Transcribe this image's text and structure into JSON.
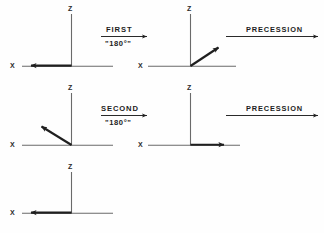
{
  "figure": {
    "ink_color": "#262626",
    "axis_color": "#555555",
    "background": "#fefefe"
  },
  "frames": [
    {
      "id": "frame-1",
      "row": 1,
      "position": "top-left",
      "z_label": "Z",
      "x_label": "X",
      "vector": {
        "direction": "minus-x",
        "angle_deg": 180,
        "description": "arrow along negative X axis"
      }
    },
    {
      "id": "frame-2",
      "row": 1,
      "position": "top-right",
      "z_label": "Z",
      "x_label": "X",
      "vector": {
        "direction": "up-right",
        "angle_deg": 33,
        "description": "arrow up and to the right from origin"
      }
    },
    {
      "id": "frame-3",
      "row": 2,
      "position": "middle-left",
      "z_label": "Z",
      "x_label": "X",
      "vector": {
        "direction": "up-left",
        "angle_deg": 147,
        "description": "arrow up and to the left from origin"
      }
    },
    {
      "id": "frame-4",
      "row": 2,
      "position": "middle-right",
      "z_label": "Z",
      "x_label": "X",
      "vector": {
        "direction": "plus-x",
        "angle_deg": 0,
        "description": "arrow along positive X axis"
      }
    },
    {
      "id": "frame-5",
      "row": 3,
      "position": "bottom-left",
      "z_label": "Z",
      "x_label": "X",
      "vector": {
        "direction": "minus-x",
        "angle_deg": 180,
        "description": "arrow along negative X axis"
      }
    }
  ],
  "operations": [
    {
      "id": "op-first",
      "row": 1,
      "label_top": "FIRST",
      "label_bottom": "\"180°\"",
      "arrow": "right-arrow"
    },
    {
      "id": "op-precession-1",
      "row": 1,
      "label_top": "PRECESSION",
      "label_bottom": "",
      "arrow": "right-arrow"
    },
    {
      "id": "op-second",
      "row": 2,
      "label_top": "SECOND",
      "label_bottom": "\"180°\"",
      "arrow": "right-arrow"
    },
    {
      "id": "op-precession-2",
      "row": 2,
      "label_top": "PRECESSION",
      "label_bottom": "",
      "arrow": "right-arrow"
    }
  ]
}
